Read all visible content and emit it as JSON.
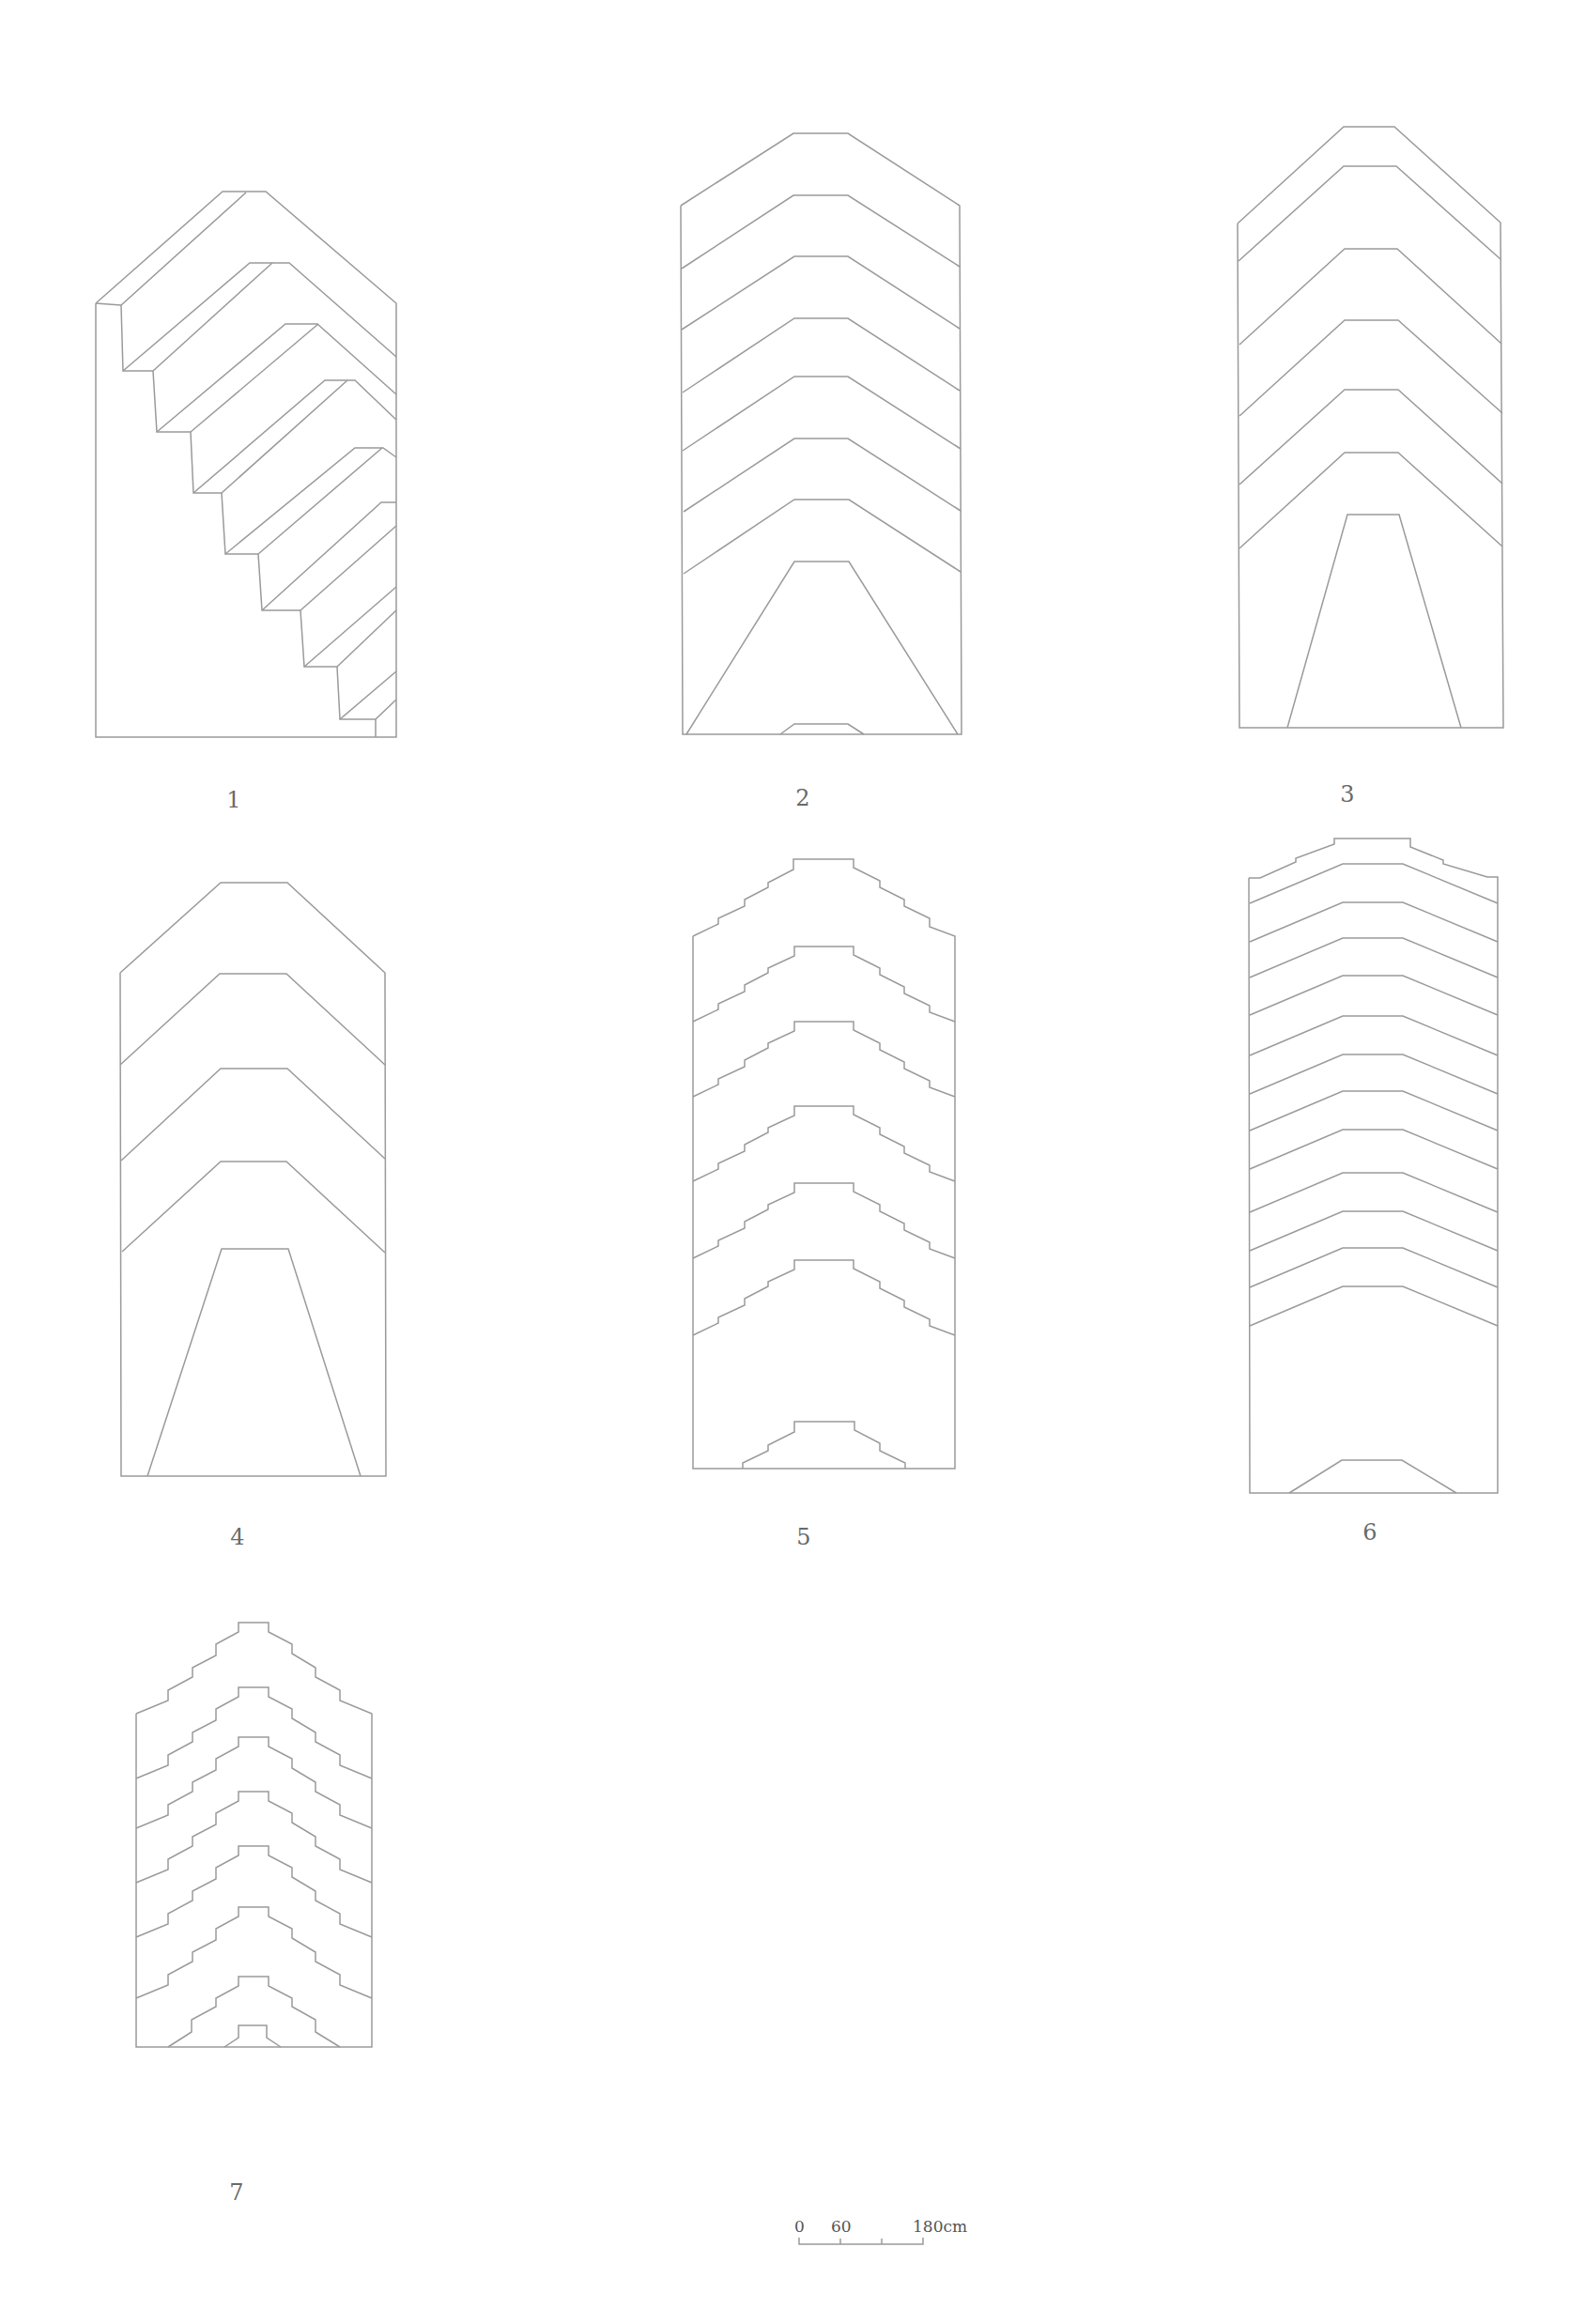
{
  "figure_labels": [
    "1",
    "2",
    "3",
    "4",
    "5",
    "6",
    "7"
  ],
  "scale_bar": {
    "ticks": [
      "0",
      "60",
      "180cm"
    ],
    "unit": "cm"
  },
  "colors": {
    "line": "#9a9a9a",
    "label": "#6a6a6a",
    "background": "#ffffff"
  }
}
